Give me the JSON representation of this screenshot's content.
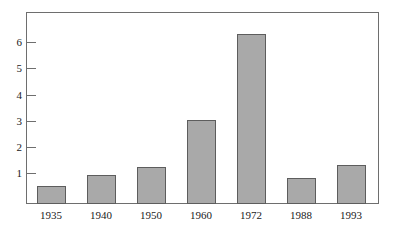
{
  "chart_data": {
    "type": "bar",
    "title": "",
    "subtitle": "",
    "xlabel": "",
    "ylabel": "",
    "categories": [
      "1935",
      "1940",
      "1950",
      "1960",
      "1972",
      "1988",
      "1993"
    ],
    "values": [
      0.7,
      1.1,
      1.4,
      3.2,
      6.5,
      1.0,
      1.5
    ],
    "series": [
      {
        "name": "",
        "values": [
          0.7,
          1.1,
          1.4,
          3.2,
          6.5,
          1.0,
          1.5
        ]
      }
    ],
    "ylim": [
      0,
      7.3
    ],
    "xlim": [
      0,
      7
    ],
    "y_ticks": [
      1,
      2,
      3,
      4,
      5,
      6
    ],
    "y_tick_labels": [
      "1",
      "2",
      "3",
      "4",
      "5",
      "6"
    ],
    "x_tick_labels": [
      "1935",
      "1940",
      "1950",
      "1960",
      "1972",
      "1988",
      "1993"
    ],
    "grid": false,
    "legend": false,
    "legend_position": "none",
    "annotations": [],
    "colors": {
      "bar_fill": "#a9a9a9",
      "bar_border": "#5d5d5d",
      "axis": "#6e6e6e",
      "text": "#1a1a1a",
      "background": "#ffffff"
    }
  }
}
